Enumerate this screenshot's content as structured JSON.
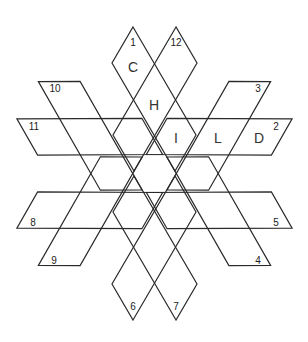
{
  "diagram": {
    "title": "",
    "type": "hexagram-word-puzzle",
    "center": [
      154.5,
      173.5
    ],
    "stroke_color": "#2a2a2a",
    "strip_numbers": [
      {
        "n": "1",
        "x": 133,
        "y": 46
      },
      {
        "n": "12",
        "x": 176,
        "y": 46
      },
      {
        "n": "3",
        "x": 258,
        "y": 92
      },
      {
        "n": "2",
        "x": 276,
        "y": 130
      },
      {
        "n": "5",
        "x": 276,
        "y": 226
      },
      {
        "n": "4",
        "x": 258,
        "y": 264
      },
      {
        "n": "7",
        "x": 176,
        "y": 310
      },
      {
        "n": "6",
        "x": 133,
        "y": 310
      },
      {
        "n": "9",
        "x": 54,
        "y": 264
      },
      {
        "n": "8",
        "x": 33,
        "y": 226
      },
      {
        "n": "11",
        "x": 34,
        "y": 130
      },
      {
        "n": "10",
        "x": 55,
        "y": 92
      }
    ],
    "letters": [
      {
        "ch": "C",
        "x": 133,
        "y": 72
      },
      {
        "ch": "H",
        "x": 154,
        "y": 110
      },
      {
        "ch": "I",
        "x": 176,
        "y": 143
      },
      {
        "ch": "L",
        "x": 218,
        "y": 143
      },
      {
        "ch": "D",
        "x": 259,
        "y": 143
      }
    ]
  }
}
